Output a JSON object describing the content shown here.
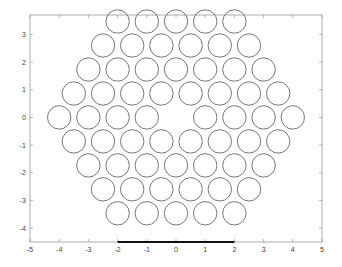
{
  "chart_data": {
    "type": "scatter",
    "title": "",
    "xlabel": "",
    "ylabel": "",
    "xlim": [
      -5,
      5
    ],
    "ylim": [
      -4.5,
      3.7
    ],
    "grid": false,
    "legend": null,
    "x_ticks": [
      "-5",
      "-4",
      "-3",
      "-2",
      "-1",
      "0",
      "1",
      "2",
      "3",
      "4",
      "5"
    ],
    "y_ticks": [
      "3",
      "2",
      "1",
      "0",
      "-1",
      "-2",
      "-3",
      "-4"
    ],
    "marker": "open-circle",
    "marker_radius_units": 0.4,
    "series": [
      {
        "name": "hexagonal lattice (center removed)",
        "points": [
          [
            -2,
            3.464
          ],
          [
            -1,
            3.464
          ],
          [
            0,
            3.464
          ],
          [
            1,
            3.464
          ],
          [
            2,
            3.464
          ],
          [
            -2.5,
            2.598
          ],
          [
            -1.5,
            2.598
          ],
          [
            -0.5,
            2.598
          ],
          [
            0.5,
            2.598
          ],
          [
            1.5,
            2.598
          ],
          [
            2.5,
            2.598
          ],
          [
            -3,
            1.732
          ],
          [
            -2,
            1.732
          ],
          [
            -1,
            1.732
          ],
          [
            0,
            1.732
          ],
          [
            1,
            1.732
          ],
          [
            2,
            1.732
          ],
          [
            3,
            1.732
          ],
          [
            -3.5,
            0.866
          ],
          [
            -2.5,
            0.866
          ],
          [
            -1.5,
            0.866
          ],
          [
            -0.5,
            0.866
          ],
          [
            0.5,
            0.866
          ],
          [
            1.5,
            0.866
          ],
          [
            2.5,
            0.866
          ],
          [
            3.5,
            0.866
          ],
          [
            -4,
            0
          ],
          [
            -3,
            0
          ],
          [
            -2,
            0
          ],
          [
            -1,
            0
          ],
          [
            1,
            0
          ],
          [
            2,
            0
          ],
          [
            3,
            0
          ],
          [
            4,
            0
          ],
          [
            -3.5,
            -0.866
          ],
          [
            -2.5,
            -0.866
          ],
          [
            -1.5,
            -0.866
          ],
          [
            -0.5,
            -0.866
          ],
          [
            0.5,
            -0.866
          ],
          [
            1.5,
            -0.866
          ],
          [
            2.5,
            -0.866
          ],
          [
            3.5,
            -0.866
          ],
          [
            -3,
            -1.732
          ],
          [
            -2,
            -1.732
          ],
          [
            -1,
            -1.732
          ],
          [
            0,
            -1.732
          ],
          [
            1,
            -1.732
          ],
          [
            2,
            -1.732
          ],
          [
            3,
            -1.732
          ],
          [
            -2.5,
            -2.598
          ],
          [
            -1.5,
            -2.598
          ],
          [
            -0.5,
            -2.598
          ],
          [
            0.5,
            -2.598
          ],
          [
            1.5,
            -2.598
          ],
          [
            2.5,
            -2.598
          ],
          [
            -2,
            -3.464
          ],
          [
            -1,
            -3.464
          ],
          [
            0,
            -3.464
          ],
          [
            1,
            -3.464
          ],
          [
            2,
            -3.464
          ]
        ]
      }
    ],
    "annotations": [
      {
        "type": "thick-line",
        "x": [
          -2,
          2
        ],
        "y": -4.5,
        "color": "#000000"
      }
    ]
  },
  "colors": {
    "circle_stroke": "#555555",
    "axes": "#888888",
    "bar": "#111111"
  }
}
